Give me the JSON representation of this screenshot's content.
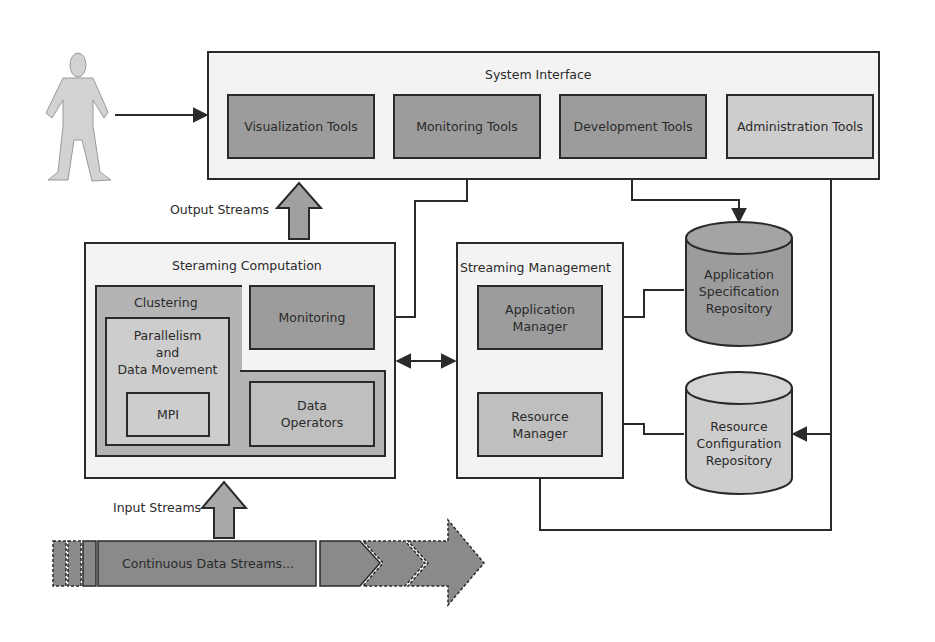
{
  "colors": {
    "dark_fill": "#9a9a9a",
    "mid_fill": "#b4b4b4",
    "light_fill": "#cfcfcf",
    "panel_fill": "#f3f3f3",
    "stroke": "#2a2a2a"
  },
  "actor": {
    "label": "User"
  },
  "system_interface": {
    "title": "System Interface",
    "tools": [
      {
        "label": "Visualization Tools"
      },
      {
        "label": "Monitoring Tools"
      },
      {
        "label": "Development Tools"
      },
      {
        "label": "Administration Tools"
      }
    ]
  },
  "output_streams": {
    "label": "Output Streams"
  },
  "input_streams": {
    "label": "Input Streams"
  },
  "streaming_computation": {
    "title": "Steraming Computation",
    "clustering": {
      "title": "Clustering"
    },
    "parallelism": {
      "title": "Parallelism\nand\nData Movement",
      "line1": "Parallelism",
      "line2": "and",
      "line3": "Data Movement"
    },
    "mpi": {
      "label": "MPI"
    },
    "monitoring": {
      "label": "Monitoring"
    },
    "data_operators": {
      "line1": "Data",
      "line2": "Operators"
    }
  },
  "streaming_management": {
    "title": "Streaming Management",
    "application_manager": {
      "line1": "Application",
      "line2": "Manager"
    },
    "resource_manager": {
      "line1": "Resource",
      "line2": "Manager"
    }
  },
  "repositories": {
    "application_spec": {
      "line1": "Application",
      "line2": "Specification",
      "line3": "Repository"
    },
    "resource_config": {
      "line1": "Resource",
      "line2": "Configuration",
      "line3": "Repository"
    }
  },
  "data_stream": {
    "label": "Continuous Data Streams..."
  }
}
